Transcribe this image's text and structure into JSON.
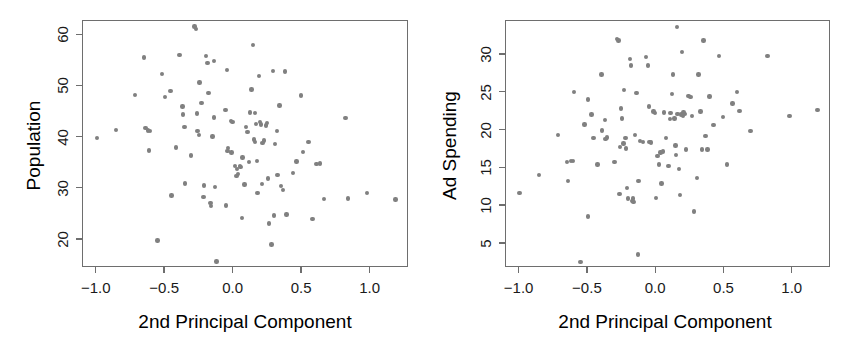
{
  "chart_data": [
    {
      "type": "scatter",
      "panel": "left",
      "title": "",
      "xlabel": "2nd Principal Component",
      "ylabel": "Population",
      "xlim": [
        -1.1,
        1.28
      ],
      "ylim": [
        14.5,
        62.8
      ],
      "xticks": [
        -1.0,
        -0.5,
        0.0,
        0.5,
        1.0
      ],
      "xticklabels": [
        "-1.0",
        "-0.5",
        "0.0",
        "0.5",
        "1.0"
      ],
      "yticks": [
        20,
        30,
        40,
        50,
        60
      ],
      "yticklabels": [
        "20",
        "30",
        "40",
        "50",
        "60"
      ],
      "grid": false,
      "legend": false,
      "marker_color": "#808080",
      "frame_color": "#6e6e6e",
      "points": [
        [
          -1.0,
          39.9
        ],
        [
          -0.86,
          41.5
        ],
        [
          -0.72,
          48.3
        ],
        [
          -0.645,
          41.9
        ],
        [
          -0.625,
          41.4
        ],
        [
          -0.61,
          41.3
        ],
        [
          -0.62,
          37.5
        ],
        [
          -0.655,
          55.7
        ],
        [
          -0.555,
          19.9
        ],
        [
          -0.525,
          52.4
        ],
        [
          -0.5,
          47.9
        ],
        [
          -0.46,
          49.1
        ],
        [
          -0.455,
          28.7
        ],
        [
          -0.42,
          38.1
        ],
        [
          -0.395,
          56.1
        ],
        [
          -0.375,
          46.1
        ],
        [
          -0.37,
          44.5
        ],
        [
          -0.36,
          42.1
        ],
        [
          -0.355,
          31.0
        ],
        [
          -0.31,
          36.5
        ],
        [
          -0.285,
          61.7
        ],
        [
          -0.275,
          61.2
        ],
        [
          -0.27,
          44.7
        ],
        [
          -0.265,
          41.3
        ],
        [
          -0.255,
          40.5
        ],
        [
          -0.25,
          50.8
        ],
        [
          -0.235,
          46.8
        ],
        [
          -0.22,
          28.4
        ],
        [
          -0.215,
          30.6
        ],
        [
          -0.2,
          56.0
        ],
        [
          -0.19,
          54.6
        ],
        [
          -0.185,
          48.7
        ],
        [
          -0.17,
          27.2
        ],
        [
          -0.165,
          26.6
        ],
        [
          -0.155,
          40.2
        ],
        [
          -0.145,
          55.0
        ],
        [
          -0.135,
          30.3
        ],
        [
          -0.125,
          15.8
        ],
        [
          -0.06,
          45.4
        ],
        [
          -0.05,
          53.2
        ],
        [
          -0.045,
          37.4
        ],
        [
          -0.04,
          38.0
        ],
        [
          -0.02,
          43.3
        ],
        [
          -0.01,
          43.0
        ],
        [
          0.01,
          34.4
        ],
        [
          0.02,
          32.5
        ],
        [
          0.025,
          33.9
        ],
        [
          0.03,
          32.9
        ],
        [
          0.045,
          34.5
        ],
        [
          0.05,
          34.3
        ],
        [
          0.06,
          24.3
        ],
        [
          0.08,
          30.8
        ],
        [
          0.09,
          42.1
        ],
        [
          0.1,
          41.1
        ],
        [
          0.11,
          35.2
        ],
        [
          0.12,
          44.9
        ],
        [
          0.13,
          49.4
        ],
        [
          0.14,
          58.1
        ],
        [
          0.15,
          39.6
        ],
        [
          0.155,
          39.1
        ],
        [
          0.165,
          42.7
        ],
        [
          0.17,
          35.4
        ],
        [
          0.175,
          29.2
        ],
        [
          0.185,
          52.1
        ],
        [
          0.19,
          43.0
        ],
        [
          0.2,
          42.6
        ],
        [
          0.21,
          39.0
        ],
        [
          0.22,
          39.4
        ],
        [
          0.235,
          42.4
        ],
        [
          0.245,
          42.9
        ],
        [
          0.25,
          32.0
        ],
        [
          0.26,
          23.2
        ],
        [
          0.275,
          19.1
        ],
        [
          0.285,
          53.0
        ],
        [
          0.295,
          24.8
        ],
        [
          0.3,
          38.8
        ],
        [
          0.315,
          41.3
        ],
        [
          0.32,
          32.7
        ],
        [
          0.335,
          46.3
        ],
        [
          0.345,
          30.5
        ],
        [
          0.36,
          29.7
        ],
        [
          0.375,
          52.9
        ],
        [
          0.435,
          33.1
        ],
        [
          0.46,
          35.3
        ],
        [
          0.49,
          48.2
        ],
        [
          0.505,
          37.2
        ],
        [
          0.545,
          39.2
        ],
        [
          0.575,
          24.1
        ],
        [
          0.605,
          34.8
        ],
        [
          0.63,
          34.9
        ],
        [
          0.66,
          28.0
        ],
        [
          0.815,
          43.8
        ],
        [
          0.835,
          28.1
        ],
        [
          0.975,
          29.2
        ],
        [
          1.18,
          27.9
        ],
        [
          -0.145,
          43.9
        ],
        [
          0.155,
          44.8
        ],
        [
          -0.055,
          26.7
        ],
        [
          0.065,
          36.1
        ],
        [
          0.205,
          30.9
        ],
        [
          0.385,
          25.0
        ],
        [
          -0.015,
          37.1
        ]
      ]
    },
    {
      "type": "scatter",
      "panel": "right",
      "title": "",
      "xlabel": "2nd Principal Component",
      "ylabel": "Ad Spending",
      "xlim": [
        -1.1,
        1.28
      ],
      "ylim": [
        1.8,
        34.5
      ],
      "xticks": [
        -1.0,
        -0.5,
        0.0,
        0.5,
        1.0
      ],
      "xticklabels": [
        "-1.0",
        "-0.5",
        "0.0",
        "0.5",
        "1.0"
      ],
      "yticks": [
        5,
        10,
        15,
        20,
        25,
        30
      ],
      "yticklabels": [
        "5",
        "10",
        "15",
        "20",
        "25",
        "30"
      ],
      "grid": false,
      "legend": false,
      "marker_color": "#808080",
      "frame_color": "#6e6e6e",
      "points": [
        [
          -1.0,
          11.7
        ],
        [
          -0.86,
          14.1
        ],
        [
          -0.72,
          19.4
        ],
        [
          -0.655,
          15.8
        ],
        [
          -0.645,
          13.3
        ],
        [
          -0.625,
          16.0
        ],
        [
          -0.61,
          16.0
        ],
        [
          -0.6,
          25.1
        ],
        [
          -0.555,
          2.6
        ],
        [
          -0.525,
          20.8
        ],
        [
          -0.5,
          24.1
        ],
        [
          -0.5,
          8.6
        ],
        [
          -0.475,
          22.1
        ],
        [
          -0.46,
          19.0
        ],
        [
          -0.43,
          15.5
        ],
        [
          -0.4,
          27.4
        ],
        [
          -0.395,
          20.0
        ],
        [
          -0.375,
          21.4
        ],
        [
          -0.37,
          18.9
        ],
        [
          -0.36,
          19.1
        ],
        [
          -0.305,
          15.8
        ],
        [
          -0.285,
          32.1
        ],
        [
          -0.275,
          31.9
        ],
        [
          -0.27,
          11.6
        ],
        [
          -0.26,
          22.9
        ],
        [
          -0.25,
          21.6
        ],
        [
          -0.24,
          18.3
        ],
        [
          -0.235,
          25.4
        ],
        [
          -0.225,
          19.0
        ],
        [
          -0.22,
          17.6
        ],
        [
          -0.215,
          12.4
        ],
        [
          -0.205,
          11.0
        ],
        [
          -0.19,
          29.5
        ],
        [
          -0.185,
          28.6
        ],
        [
          -0.175,
          10.7
        ],
        [
          -0.17,
          11.0
        ],
        [
          -0.165,
          10.5
        ],
        [
          -0.155,
          19.4
        ],
        [
          -0.145,
          25.0
        ],
        [
          -0.135,
          3.6
        ],
        [
          -0.13,
          13.3
        ],
        [
          -0.12,
          18.6
        ],
        [
          -0.075,
          29.7
        ],
        [
          -0.06,
          28.6
        ],
        [
          -0.055,
          23.2
        ],
        [
          -0.05,
          18.5
        ],
        [
          -0.04,
          18.4
        ],
        [
          -0.02,
          22.5
        ],
        [
          -0.01,
          22.3
        ],
        [
          0.0,
          11.1
        ],
        [
          0.01,
          16.6
        ],
        [
          0.02,
          15.5
        ],
        [
          0.03,
          17.1
        ],
        [
          0.04,
          13.0
        ],
        [
          0.05,
          17.2
        ],
        [
          0.07,
          19.0
        ],
        [
          0.09,
          15.3
        ],
        [
          0.1,
          21.5
        ],
        [
          0.105,
          22.3
        ],
        [
          0.115,
          24.8
        ],
        [
          0.125,
          27.4
        ],
        [
          0.135,
          21.6
        ],
        [
          0.14,
          18.0
        ],
        [
          0.15,
          33.7
        ],
        [
          0.155,
          22.2
        ],
        [
          0.165,
          14.9
        ],
        [
          0.175,
          11.5
        ],
        [
          0.18,
          22.1
        ],
        [
          0.19,
          30.4
        ],
        [
          0.2,
          22.4
        ],
        [
          0.21,
          22.2
        ],
        [
          0.22,
          17.5
        ],
        [
          0.235,
          24.6
        ],
        [
          0.25,
          24.4
        ],
        [
          0.26,
          21.9
        ],
        [
          0.275,
          9.3
        ],
        [
          0.3,
          13.7
        ],
        [
          0.31,
          27.4
        ],
        [
          0.325,
          22.5
        ],
        [
          0.335,
          17.5
        ],
        [
          0.345,
          31.9
        ],
        [
          0.36,
          19.3
        ],
        [
          0.375,
          17.5
        ],
        [
          0.39,
          24.5
        ],
        [
          0.42,
          20.7
        ],
        [
          0.46,
          29.9
        ],
        [
          0.49,
          21.8
        ],
        [
          0.52,
          15.5
        ],
        [
          0.56,
          23.6
        ],
        [
          0.59,
          25.1
        ],
        [
          0.61,
          22.6
        ],
        [
          0.69,
          19.9
        ],
        [
          0.815,
          29.9
        ],
        [
          0.975,
          21.9
        ],
        [
          1.18,
          22.7
        ],
        [
          -0.265,
          17.8
        ],
        [
          0.055,
          22.4
        ],
        [
          0.145,
          16.8
        ],
        [
          -0.095,
          18.5
        ],
        [
          0.195,
          21.9
        ]
      ]
    }
  ]
}
